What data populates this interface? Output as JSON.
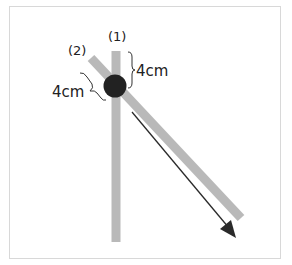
{
  "diagram": {
    "labels": {
      "rod1": "(1)",
      "rod2": "(2)",
      "dist_vertical": "4cm",
      "dist_diagonal": "4cm"
    },
    "colors": {
      "rod": "#b9b9b9",
      "ball": "#222222",
      "arrow": "#2a2a2a",
      "frame": "#d8d8d8"
    },
    "elements": {
      "rod1": "vertical gray rod",
      "rod2": "diagonal gray rod",
      "ball": "black ball at rod intersection",
      "arrow": "arrow pointing down-right along rod (2)"
    }
  }
}
